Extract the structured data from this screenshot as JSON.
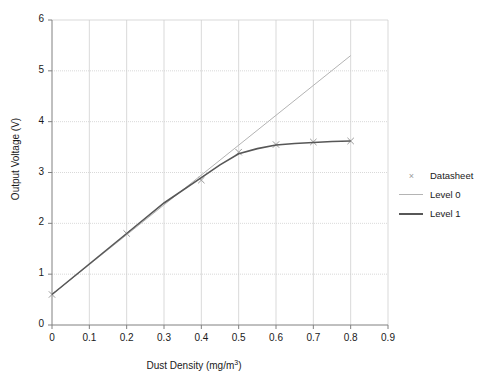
{
  "chart_data": {
    "type": "line",
    "title": "",
    "xlabel": "Dust Density (mg/m",
    "xlabel_sup": "3",
    "xlabel_tail": ")",
    "ylabel": "Output Voltage (V)",
    "xlim": [
      0,
      0.9
    ],
    "ylim": [
      0,
      6
    ],
    "xticks": [
      "0",
      "0.1",
      "0.2",
      "0.3",
      "0.4",
      "0.5",
      "0.6",
      "0.7",
      "0.8",
      "0.9"
    ],
    "xtick_values": [
      0,
      0.1,
      0.2,
      0.3,
      0.4,
      0.5,
      0.6,
      0.7,
      0.8,
      0.9
    ],
    "yticks": [
      "0",
      "1",
      "2",
      "3",
      "4",
      "5",
      "6"
    ],
    "ytick_values": [
      0,
      1,
      2,
      3,
      4,
      5,
      6
    ],
    "grid": true,
    "legend_position": "right",
    "series": [
      {
        "name": "Datasheet",
        "style": "marker",
        "marker": "x",
        "color": "#9a9a9a",
        "x": [
          0,
          0.2,
          0.4,
          0.5,
          0.6,
          0.7,
          0.8
        ],
        "values": [
          0.6,
          1.8,
          2.85,
          3.4,
          3.55,
          3.6,
          3.62
        ]
      },
      {
        "name": "Level 0",
        "style": "line",
        "color": "#b4b4b4",
        "x": [
          0,
          0.8
        ],
        "values": [
          0.6,
          5.3
        ]
      },
      {
        "name": "Level 1",
        "style": "line",
        "color": "#575757",
        "x": [
          0,
          0.1,
          0.2,
          0.3,
          0.4,
          0.45,
          0.5,
          0.55,
          0.6,
          0.65,
          0.7,
          0.75,
          0.8
        ],
        "values": [
          0.6,
          1.2,
          1.8,
          2.4,
          2.9,
          3.15,
          3.37,
          3.47,
          3.54,
          3.57,
          3.59,
          3.61,
          3.62
        ]
      }
    ]
  },
  "legend": {
    "items": [
      {
        "label": "Datasheet",
        "key": "x-marker",
        "color": "#9a9a9a"
      },
      {
        "label": "Level 0",
        "key": "line",
        "color": "#b4b4b4"
      },
      {
        "label": "Level 1",
        "key": "line",
        "color": "#575757"
      }
    ]
  },
  "colors": {
    "axis": "#808080",
    "grid": "#cfcfcf",
    "text": "#1a1a1a",
    "level0": "#b4b4b4",
    "level1": "#575757",
    "datasheet": "#9a9a9a",
    "background": "#ffffff"
  }
}
